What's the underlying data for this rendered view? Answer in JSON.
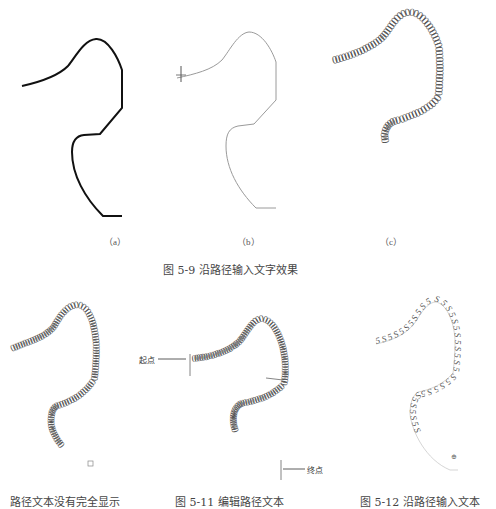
{
  "figure_5_9": {
    "caption": "图 5-9   沿路径输入文字效果",
    "panels": [
      {
        "label": "（a）",
        "description": "black path line"
      },
      {
        "label": "（b）",
        "description": "gray path with start marker"
      },
      {
        "label": "（c）",
        "description": "text along path"
      }
    ],
    "path_text_c": "0000000000000000000000000000000000000000000000000000000000000000000000000000000"
  },
  "figure_5_10": {
    "caption": "路径文本没有完全显示",
    "path_text": "000000000000000000000000000000000000000000000000000000000000000000000000000000000000000000000000",
    "overflow_marker": "⊞"
  },
  "figure_5_11": {
    "caption": "图 5-11   编辑路径文本",
    "start_label": "起点",
    "end_label": "终点",
    "path_text": "000000000000000000000000000000000000000000000000000000000000000000000000000000000000000000000000"
  },
  "figure_5_12": {
    "caption": "图 5-12   沿路径输入文本",
    "path_text": "5S5S5S5S5S5S5S5S5S5S5S5S5S5S5S5S5S5S",
    "marker": "⊕"
  },
  "colors": {
    "path_black": "#111111",
    "path_gray": "#9a9a9a",
    "text_gray": "#555555"
  }
}
